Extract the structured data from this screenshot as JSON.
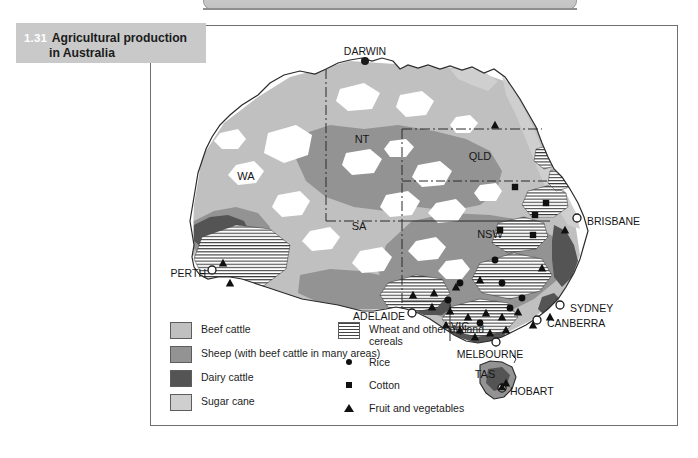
{
  "figure": {
    "number": "1.31",
    "title_line1": "Agricultural production",
    "title_line2": "in Australia"
  },
  "map": {
    "country": "Australia",
    "states": [
      {
        "code": "WA",
        "x": 96,
        "y": 155
      },
      {
        "code": "NT",
        "x": 212,
        "y": 118
      },
      {
        "code": "QLD",
        "x": 330,
        "y": 135
      },
      {
        "code": "SA",
        "x": 209,
        "y": 205
      },
      {
        "code": "NSW",
        "x": 340,
        "y": 213
      },
      {
        "code": "VIC",
        "x": 310,
        "y": 305
      },
      {
        "code": "TAS",
        "x": 335,
        "y": 353
      }
    ],
    "cities": [
      {
        "name": "DARWIN",
        "marker": "filled-dot",
        "mx": 215,
        "my": 36,
        "tx": 215,
        "ty": 27,
        "anchor": "middle"
      },
      {
        "name": "BRISBANE",
        "marker": "open-dot",
        "mx": 427,
        "my": 193,
        "tx": 437,
        "ty": 197,
        "anchor": "start"
      },
      {
        "name": "PERTH",
        "marker": "open-dot",
        "mx": 62,
        "my": 245,
        "tx": 56,
        "ty": 249,
        "anchor": "end"
      },
      {
        "name": "ADELAIDE",
        "marker": "open-dot",
        "mx": 262,
        "my": 288,
        "tx": 255,
        "ty": 292,
        "anchor": "end"
      },
      {
        "name": "SYDNEY",
        "marker": "open-dot",
        "mx": 410,
        "my": 280,
        "tx": 420,
        "ty": 284,
        "anchor": "start"
      },
      {
        "name": "CANBERRA",
        "marker": "open-dot",
        "mx": 387,
        "my": 295,
        "tx": 397,
        "ty": 299,
        "anchor": "start"
      },
      {
        "name": "MELBOURNE",
        "marker": "open-dot",
        "mx": 346,
        "my": 317,
        "tx": 340,
        "ty": 330,
        "anchor": "middle"
      },
      {
        "name": "HOBART",
        "marker": "open-dot",
        "mx": 352,
        "my": 363,
        "tx": 360,
        "ty": 367,
        "anchor": "start"
      }
    ],
    "rice_points": [
      [
        310,
        258
      ],
      [
        298,
        275
      ],
      [
        345,
        235
      ],
      [
        352,
        258
      ],
      [
        360,
        283
      ],
      [
        330,
        298
      ],
      [
        372,
        273
      ]
    ],
    "cotton_points": [
      [
        365,
        162
      ],
      [
        385,
        190
      ],
      [
        383,
        210
      ],
      [
        350,
        205
      ],
      [
        396,
        178
      ]
    ],
    "fruit_points": [
      [
        345,
        100
      ],
      [
        415,
        205
      ],
      [
        392,
        243
      ],
      [
        330,
        255
      ],
      [
        306,
        262
      ],
      [
        284,
        268
      ],
      [
        263,
        270
      ],
      [
        282,
        282
      ],
      [
        300,
        286
      ],
      [
        318,
        292
      ],
      [
        336,
        288
      ],
      [
        352,
        292
      ],
      [
        368,
        287
      ],
      [
        383,
        300
      ],
      [
        400,
        292
      ],
      [
        356,
        305
      ],
      [
        340,
        308
      ],
      [
        325,
        312
      ],
      [
        310,
        305
      ],
      [
        296,
        300
      ],
      [
        73,
        238
      ],
      [
        80,
        258
      ],
      [
        352,
        362
      ],
      [
        356,
        358
      ]
    ]
  },
  "legend": {
    "left_items": [
      {
        "label": "Beef cattle",
        "color": "#c0c0c0",
        "kind": "swatch"
      },
      {
        "label": "Sheep (with beef cattle in many areas)",
        "color": "#939393",
        "kind": "swatch"
      },
      {
        "label": "Dairy cattle",
        "color": "#545454",
        "kind": "swatch"
      },
      {
        "label": "Sugar cane",
        "color": "#cfcfcf",
        "kind": "swatch"
      }
    ],
    "right_items": [
      {
        "label": "Wheat and other dryland cereals",
        "kind": "hatch"
      },
      {
        "label": "Rice",
        "kind": "dot"
      },
      {
        "label": "Cotton",
        "kind": "square"
      },
      {
        "label": "Fruit and vegetables",
        "kind": "triangle"
      }
    ]
  },
  "colors": {
    "beef": "#c0c0c0",
    "sheep": "#939393",
    "dairy": "#545454",
    "sugar": "#cfcfcf",
    "frame": "#6f6f6f",
    "title_plaque": "#c9c9c9"
  }
}
